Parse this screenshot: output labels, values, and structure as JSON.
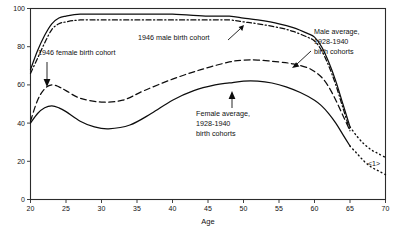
{
  "chart_data": {
    "type": "line",
    "title": "",
    "subtitle": "",
    "xlabel": "Age",
    "ylabel": "",
    "xlim": [
      20,
      70
    ],
    "ylim": [
      0,
      100
    ],
    "grid": false,
    "legend_position": "inline-annotations",
    "xticks": [
      20,
      25,
      30,
      35,
      40,
      45,
      50,
      55,
      60,
      65,
      70
    ],
    "yticks": [
      0,
      20,
      40,
      60,
      80,
      100
    ],
    "xtick_labels": [
      "20",
      "25",
      "30",
      "35",
      "40",
      "45",
      "50",
      "55",
      "60",
      "65",
      "70"
    ],
    "ytick_labels": [
      "0",
      "20",
      "40",
      "60",
      "80",
      "100"
    ],
    "series": [
      {
        "name": "Male average, 1928-1940 birth cohorts",
        "style": "solid",
        "x": [
          20,
          21,
          22,
          23,
          24,
          25,
          27,
          30,
          35,
          40,
          45,
          48,
          50,
          52,
          55,
          57,
          59,
          60,
          61,
          62,
          63,
          64,
          65
        ],
        "values": [
          68,
          78,
          86,
          92,
          95,
          96,
          97,
          97,
          97,
          97,
          96,
          96,
          95,
          94,
          92,
          90,
          87,
          85,
          80,
          72,
          62,
          50,
          38
        ]
      },
      {
        "name": "Male average projection",
        "style": "dotted",
        "x": [
          65,
          66,
          67,
          68,
          69,
          70
        ],
        "values": [
          38,
          33,
          29,
          26,
          24,
          22
        ]
      },
      {
        "name": "1946 male birth cohort",
        "style": "dashdot",
        "x": [
          20,
          21,
          22,
          23,
          24,
          25,
          27,
          30,
          35,
          40,
          45,
          48,
          50,
          52,
          55,
          57,
          59,
          60,
          61,
          62,
          63,
          64,
          65
        ],
        "values": [
          66,
          74,
          82,
          89,
          92,
          93,
          94,
          94,
          94,
          94,
          94,
          94,
          93,
          92,
          90,
          88,
          85,
          83,
          78,
          70,
          60,
          48,
          36
        ]
      },
      {
        "name": "1946 female birth cohort",
        "style": "dashed",
        "x": [
          20,
          21,
          22,
          23,
          24,
          25,
          27,
          30,
          33,
          36,
          40,
          44,
          48,
          50,
          52,
          55,
          57,
          59,
          60,
          61,
          62,
          63,
          64,
          65
        ],
        "values": [
          41,
          52,
          58,
          60,
          59,
          57,
          53,
          51,
          52,
          57,
          63,
          68,
          72,
          73,
          73,
          72,
          71,
          69,
          67,
          64,
          59,
          52,
          44,
          36
        ]
      },
      {
        "name": "Female average, 1928-1940 birth cohorts",
        "style": "solid",
        "x": [
          20,
          21,
          22,
          23,
          24,
          25,
          27,
          29,
          31,
          34,
          37,
          40,
          43,
          46,
          48,
          50,
          52,
          54,
          56,
          58,
          60,
          61,
          62,
          63,
          64,
          65
        ],
        "values": [
          40,
          45,
          48,
          49,
          48,
          46,
          41,
          38,
          37,
          39,
          45,
          52,
          57,
          60,
          61,
          62,
          62,
          61,
          59,
          56,
          52,
          49,
          45,
          40,
          34,
          28
        ]
      },
      {
        "name": "Female average projection",
        "style": "dotted",
        "x": [
          65,
          66,
          67,
          68,
          69,
          70
        ],
        "values": [
          28,
          24,
          20,
          17,
          15,
          13
        ]
      }
    ],
    "annotations": [
      {
        "id": "female-1946-label",
        "text": "1946 female birth cohort",
        "text_x": 38,
        "text_y": 55,
        "arrow_from_x": 47,
        "arrow_from_y": 62,
        "arrow_to_x": 47,
        "arrow_to_y": 86
      },
      {
        "id": "male-1946-label",
        "text": "1946 male birth cohort",
        "text_x": 138,
        "text_y": 40,
        "arrow_from_x": 228,
        "arrow_from_y": 40,
        "arrow_to_x": 243,
        "arrow_to_y": 26
      },
      {
        "id": "male-average-label",
        "line1": "Male average,",
        "line2": "1928-1940",
        "line3": "birth cohorts",
        "text_x": 314,
        "text_y": 34,
        "arrow_from_x": 312,
        "arrow_from_y": 55,
        "arrow_to_x": 294,
        "arrow_to_y": 66
      },
      {
        "id": "female-average-label",
        "line1": "Female average,",
        "line2": "1928-1940",
        "line3": "birth cohorts",
        "text_x": 196,
        "text_y": 116,
        "arrow_from_x": 232,
        "arrow_from_y": 108,
        "arrow_to_x": 232,
        "arrow_to_y": 92
      },
      {
        "id": "reference-marker",
        "text": "<1>",
        "text_x": 374,
        "text_y": 166
      }
    ]
  }
}
